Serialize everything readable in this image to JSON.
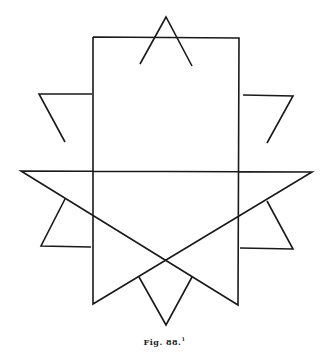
{
  "figure": {
    "caption": "Fig. 88.",
    "caption_note": "1",
    "stroke_color": "#1a1a1a"
  }
}
